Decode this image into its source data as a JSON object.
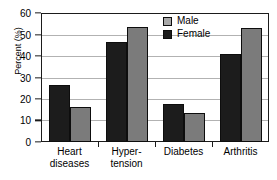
{
  "chart_data": {
    "type": "bar",
    "title": "",
    "xlabel": "",
    "ylabel": "Percent (%)",
    "ylim": [
      0,
      60
    ],
    "yticks": [
      0,
      10,
      20,
      30,
      40,
      50,
      60
    ],
    "ytick_labels": [
      "0",
      "10",
      "20",
      "30",
      "40",
      "50",
      "60"
    ],
    "grid": true,
    "legend_position": "top-right",
    "categories": [
      "Heart diseases",
      "Hypertension",
      "Diabetes",
      "Arthritis"
    ],
    "category_label_lines": [
      [
        "Heart",
        "diseases"
      ],
      [
        "Hyper-",
        "tension"
      ],
      [
        "Diabetes"
      ],
      [
        "Arthritis"
      ]
    ],
    "series": [
      {
        "name": "Female",
        "color": "#1c1c1c",
        "values": [
          26.3,
          46.5,
          17.8,
          40.8
        ]
      },
      {
        "name": "Male",
        "color": "#7b7b7b",
        "values": [
          16.2,
          53.5,
          13.3,
          52.8
        ]
      }
    ],
    "bar_order_in_group": [
      "Female",
      "Male"
    ],
    "legend_entries": [
      {
        "label": "Male",
        "swatch_color": "#a8a8a8"
      },
      {
        "label": "Female",
        "swatch_color": "#1c1c1c"
      }
    ]
  }
}
